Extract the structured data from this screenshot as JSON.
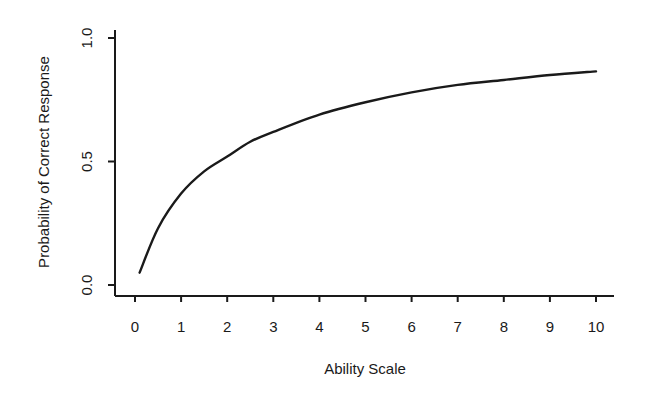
{
  "chart_data": {
    "type": "line",
    "title": "",
    "xlabel": "Ability Scale",
    "ylabel": "Probability of Correct Response",
    "xlim": [
      0,
      10
    ],
    "ylim": [
      0.0,
      1.0
    ],
    "x_ticks": [
      "0",
      "1",
      "2",
      "3",
      "4",
      "5",
      "6",
      "7",
      "8",
      "9",
      "10"
    ],
    "y_ticks": [
      "0.0",
      "0.5",
      "1.0"
    ],
    "grid": false,
    "legend": null,
    "series": [
      {
        "name": "Probability of Correct Response",
        "x": [
          0.1,
          0.5,
          1,
          1.5,
          2,
          2.5,
          3,
          4,
          5,
          6,
          7,
          8,
          9,
          10
        ],
        "y": [
          0.05,
          0.23,
          0.37,
          0.46,
          0.52,
          0.58,
          0.62,
          0.69,
          0.74,
          0.78,
          0.81,
          0.83,
          0.85,
          0.865
        ]
      }
    ],
    "color": "#1a1a1a"
  }
}
